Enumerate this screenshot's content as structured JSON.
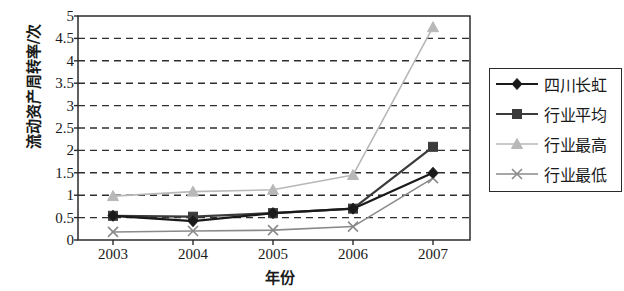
{
  "chart_data": {
    "type": "line",
    "title": "",
    "xlabel": "年份",
    "ylabel": "流动资产周转率/次",
    "categories": [
      "2003",
      "2004",
      "2005",
      "2006",
      "2007"
    ],
    "ylim": [
      0,
      5
    ],
    "ytick_step": 0.5,
    "yticks": [
      "0",
      "0.5",
      "1",
      "1.5",
      "2",
      "2.5",
      "3",
      "3.5",
      "4",
      "4.5",
      "5"
    ],
    "grid": "horizontal-dashed",
    "legend_position": "right",
    "series": [
      {
        "name": "四川长虹",
        "marker": "diamond",
        "color": "#1a1a1a",
        "values": [
          0.54,
          0.42,
          0.6,
          0.7,
          1.5
        ]
      },
      {
        "name": "行业平均",
        "marker": "square",
        "color": "#3b3b3b",
        "values": [
          0.54,
          0.52,
          0.6,
          0.7,
          2.08
        ]
      },
      {
        "name": "行业最高",
        "marker": "triangle",
        "color": "#b8b8b8",
        "values": [
          0.98,
          1.08,
          1.12,
          1.45,
          4.75
        ]
      },
      {
        "name": "行业最低",
        "marker": "cross",
        "color": "#8a8a8a",
        "values": [
          0.18,
          0.2,
          0.22,
          0.3,
          1.38
        ]
      }
    ]
  },
  "axes": {
    "x_positions": [
      113,
      193,
      273,
      353,
      433
    ],
    "plot": {
      "left": 78,
      "right": 470,
      "top": 16,
      "bottom": 240
    }
  },
  "legend": {
    "items": [
      {
        "label": "四川长虹",
        "marker": "diamond",
        "color": "#1a1a1a"
      },
      {
        "label": "行业平均",
        "marker": "square",
        "color": "#3b3b3b"
      },
      {
        "label": "行业最高",
        "marker": "triangle",
        "color": "#b8b8b8"
      },
      {
        "label": "行业最低",
        "marker": "cross",
        "color": "#8a8a8a"
      }
    ]
  }
}
